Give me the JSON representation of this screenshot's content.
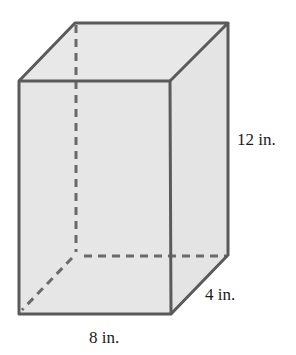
{
  "figure": {
    "shape": "rectangular-prism",
    "labels": {
      "height": "12 in.",
      "depth": "4 in.",
      "width": "8 in."
    },
    "colors": {
      "face_fill": "#e6e6e6",
      "edge": "#5a5a5a",
      "hidden_edge": "#6a6a6a"
    }
  }
}
